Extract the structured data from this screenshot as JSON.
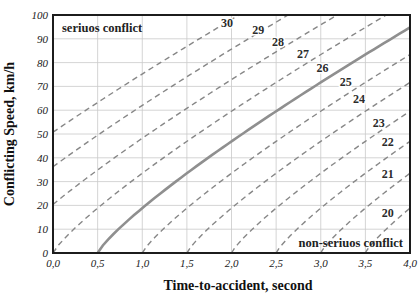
{
  "chart_data": {
    "type": "line",
    "title": "",
    "xlabel": "Time-to-accident, second",
    "ylabel": "Conflicting Speed, km/h",
    "xlim": [
      0,
      4
    ],
    "ylim": [
      0,
      100
    ],
    "x_tick_values": [
      0,
      0.5,
      1,
      1.5,
      2,
      2.5,
      3,
      3.5,
      4
    ],
    "x_tick_labels": [
      "0,0",
      "0,5",
      "1,0",
      "1,5",
      "2,0",
      "2,5",
      "3,0",
      "3,5",
      "4,0"
    ],
    "y_tick_values": [
      0,
      10,
      20,
      30,
      40,
      50,
      60,
      70,
      80,
      90,
      100
    ],
    "y_tick_labels": [
      "0",
      "10",
      "20",
      "30",
      "40",
      "50",
      "60",
      "70",
      "80",
      "90",
      "100"
    ],
    "grid": true,
    "legend": "none",
    "regions": {
      "upper_left": "seriuos conflict",
      "lower_right": "non-seriuos conflict"
    },
    "curve_model": {
      "description": "speed = k * (tta - x0)^p, clipped to y<=100; x0 is x-intercept of each severity-level curve",
      "k": 33.5,
      "p": 0.83
    },
    "curves": [
      {
        "level": "30",
        "x0": -1.65,
        "style": "dashed",
        "label_at": [
          1.95,
          95
        ]
      },
      {
        "level": "29",
        "x0": -1.1,
        "style": "dashed",
        "label_at": [
          2.3,
          92
        ]
      },
      {
        "level": "28",
        "x0": -0.55,
        "style": "dashed",
        "label_at": [
          2.52,
          87
        ]
      },
      {
        "level": "27",
        "x0": 0.0,
        "style": "dashed",
        "label_at": [
          2.8,
          82
        ]
      },
      {
        "level": "26",
        "x0": 0.5,
        "style": "solid",
        "label_at": [
          3.02,
          76
        ]
      },
      {
        "level": "25",
        "x0": 1.0,
        "style": "dashed",
        "label_at": [
          3.28,
          70
        ]
      },
      {
        "level": "24",
        "x0": 1.5,
        "style": "dashed",
        "label_at": [
          3.43,
          63
        ]
      },
      {
        "level": "23",
        "x0": 2.0,
        "style": "dashed",
        "label_at": [
          3.65,
          53
        ]
      },
      {
        "level": "22",
        "x0": 2.5,
        "style": "dashed",
        "label_at": [
          3.75,
          45
        ]
      },
      {
        "level": "21",
        "x0": 3.0,
        "style": "dashed",
        "label_at": [
          3.75,
          31.5
        ]
      },
      {
        "level": "20",
        "x0": 3.5,
        "style": "dashed",
        "label_at": [
          3.75,
          15
        ]
      }
    ],
    "colors": {
      "grid": "#c9c9c9",
      "dashed_curve": "#878787",
      "solid_curve": "#8f8f8f",
      "border": "#1c1c1c",
      "text": "#1a1a1a"
    }
  }
}
